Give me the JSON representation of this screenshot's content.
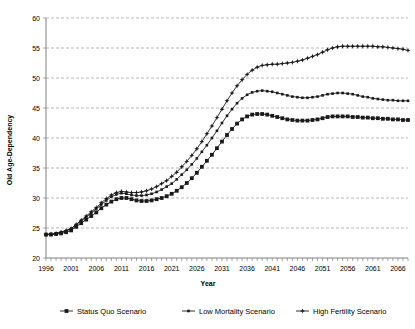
{
  "chart_data": {
    "type": "line",
    "title": "",
    "xlabel": "Year",
    "ylabel": "Old Age-Dependency",
    "xlim": [
      1996,
      2068
    ],
    "ylim": [
      20,
      60
    ],
    "ytick_values": [
      20,
      25,
      30,
      35,
      40,
      45,
      50,
      55,
      60
    ],
    "xtick_labels": [
      "1996",
      "2001",
      "2006",
      "2011",
      "2016",
      "2021",
      "2026",
      "2031",
      "2036",
      "2041",
      "2046",
      "2051",
      "2056",
      "2061",
      "2066"
    ],
    "grid": "horizontal-dashed",
    "legend_position": "bottom",
    "x": [
      1996,
      1997,
      1998,
      1999,
      2000,
      2001,
      2002,
      2003,
      2004,
      2005,
      2006,
      2007,
      2008,
      2009,
      2010,
      2011,
      2012,
      2013,
      2014,
      2015,
      2016,
      2017,
      2018,
      2019,
      2020,
      2021,
      2022,
      2023,
      2024,
      2025,
      2026,
      2027,
      2028,
      2029,
      2030,
      2031,
      2032,
      2033,
      2034,
      2035,
      2036,
      2037,
      2038,
      2039,
      2040,
      2041,
      2042,
      2043,
      2044,
      2045,
      2046,
      2047,
      2048,
      2049,
      2050,
      2051,
      2052,
      2053,
      2054,
      2055,
      2056,
      2057,
      2058,
      2059,
      2060,
      2061,
      2062,
      2063,
      2064,
      2065,
      2066,
      2067,
      2068
    ],
    "series": [
      {
        "name": "Status Quo Scenario",
        "marker": "filled-square-large",
        "values": [
          23.9,
          23.9,
          24.0,
          24.1,
          24.3,
          24.6,
          25.2,
          25.8,
          26.4,
          27.0,
          27.6,
          28.3,
          28.9,
          29.4,
          29.8,
          30.0,
          30.0,
          29.8,
          29.6,
          29.5,
          29.5,
          29.6,
          29.8,
          30.0,
          30.3,
          30.7,
          31.2,
          31.8,
          32.5,
          33.3,
          34.2,
          35.2,
          36.2,
          37.2,
          38.3,
          39.4,
          40.5,
          41.5,
          42.4,
          43.1,
          43.6,
          43.9,
          44.0,
          44.0,
          43.9,
          43.7,
          43.5,
          43.3,
          43.1,
          43.0,
          42.9,
          42.9,
          42.9,
          43.0,
          43.1,
          43.3,
          43.5,
          43.6,
          43.6,
          43.6,
          43.6,
          43.5,
          43.5,
          43.4,
          43.4,
          43.3,
          43.3,
          43.2,
          43.2,
          43.1,
          43.1,
          43.0,
          43.0
        ]
      },
      {
        "name": "Low Mortality Scenario",
        "marker": "filled-square-small",
        "values": [
          23.9,
          24.0,
          24.1,
          24.3,
          24.5,
          24.9,
          25.5,
          26.2,
          26.8,
          27.5,
          28.2,
          28.9,
          29.6,
          30.2,
          30.6,
          30.8,
          30.7,
          30.5,
          30.4,
          30.4,
          30.5,
          30.7,
          31.0,
          31.4,
          31.9,
          32.4,
          33.1,
          33.9,
          34.7,
          35.6,
          36.6,
          37.7,
          38.8,
          40.0,
          41.2,
          42.5,
          43.7,
          44.8,
          45.8,
          46.6,
          47.2,
          47.6,
          47.8,
          47.9,
          47.8,
          47.7,
          47.5,
          47.3,
          47.1,
          46.9,
          46.8,
          46.7,
          46.7,
          46.8,
          46.9,
          47.1,
          47.3,
          47.4,
          47.5,
          47.5,
          47.4,
          47.3,
          47.1,
          46.9,
          46.8,
          46.6,
          46.5,
          46.4,
          46.3,
          46.3,
          46.2,
          46.2,
          46.2
        ]
      },
      {
        "name": "High Fertility Scenario",
        "marker": "filled-star-small",
        "values": [
          23.9,
          24.0,
          24.1,
          24.3,
          24.6,
          24.9,
          25.6,
          26.3,
          27.0,
          27.7,
          28.4,
          29.2,
          29.9,
          30.5,
          30.9,
          31.1,
          31.0,
          30.9,
          30.9,
          31.0,
          31.2,
          31.5,
          31.9,
          32.4,
          32.9,
          33.6,
          34.3,
          35.2,
          36.1,
          37.1,
          38.2,
          39.4,
          40.7,
          42.0,
          43.4,
          44.8,
          46.2,
          47.5,
          48.7,
          49.7,
          50.6,
          51.3,
          51.8,
          52.1,
          52.2,
          52.3,
          52.3,
          52.4,
          52.5,
          52.6,
          52.8,
          53.0,
          53.3,
          53.6,
          53.9,
          54.3,
          54.7,
          55.0,
          55.2,
          55.3,
          55.3,
          55.3,
          55.3,
          55.3,
          55.3,
          55.3,
          55.2,
          55.2,
          55.1,
          55.0,
          54.9,
          54.8,
          54.6
        ]
      }
    ]
  },
  "legend": {
    "items": [
      {
        "label": "Status Quo Scenario"
      },
      {
        "label": "Low Mortality Scenario"
      },
      {
        "label": "High Fertility Scenario"
      }
    ]
  }
}
